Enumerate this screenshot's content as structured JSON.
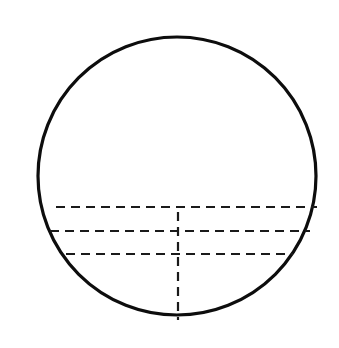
{
  "figure": {
    "background_color": "#ffffff",
    "width": 339,
    "height": 348
  },
  "circle": {
    "name": "outer-circle",
    "center_x": 177,
    "center_y": 176,
    "radius": 139,
    "stroke_color": "#0d0d0d",
    "stroke_width": 3.2,
    "fill": "none"
  },
  "chords": [
    {
      "label": "chord-upper",
      "y": 207,
      "x_start": 56,
      "x_end": 317,
      "stroke_color": "#1a1a1a",
      "stroke_width": 2.2,
      "dash_array": "9 6"
    },
    {
      "label": "chord-middle",
      "y": 231,
      "x_start": 50,
      "x_end": 310,
      "stroke_color": "#1a1a1a",
      "stroke_width": 2.2,
      "dash_array": "9 6"
    },
    {
      "label": "chord-lower",
      "y": 254,
      "x_start": 66,
      "x_end": 293,
      "stroke_color": "#1a1a1a",
      "stroke_width": 2.0,
      "dash_array": "9 6"
    }
  ],
  "vertical_line": {
    "label": "vertical-axis",
    "x": 178,
    "y_start": 212,
    "y_end": 320,
    "stroke_color": "#1a1a1a",
    "stroke_width": 2.2,
    "dash_array": "9 6"
  }
}
